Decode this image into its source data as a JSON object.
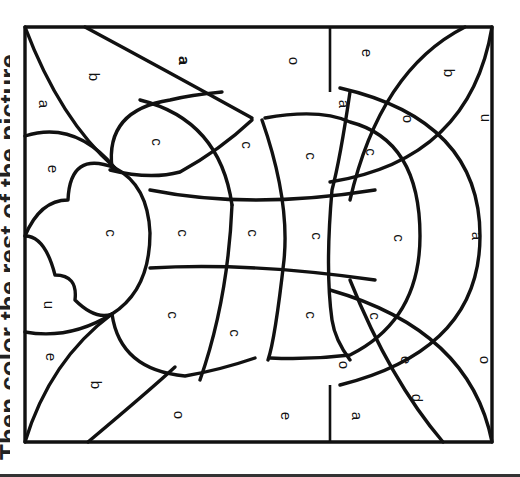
{
  "instructions": {
    "text": "Then color the rest of the picture."
  },
  "colors": {
    "line": "#111111",
    "background": "#ffffff"
  },
  "regions": [
    {
      "letter": "a",
      "x": 43,
      "y": 104
    },
    {
      "letter": "b",
      "x": 93,
      "y": 77
    },
    {
      "letter": "a",
      "x": 183,
      "y": 61
    },
    {
      "letter": "o",
      "x": 293,
      "y": 61
    },
    {
      "letter": "e",
      "x": 366,
      "y": 53
    },
    {
      "letter": "b",
      "x": 448,
      "y": 73
    },
    {
      "letter": "a",
      "x": 343,
      "y": 104
    },
    {
      "letter": "a",
      "x": 183,
      "y": 60
    },
    {
      "letter": "o",
      "x": 407,
      "y": 119
    },
    {
      "letter": "u",
      "x": 485,
      "y": 118
    },
    {
      "letter": "c",
      "x": 156,
      "y": 142
    },
    {
      "letter": "c",
      "x": 246,
      "y": 145
    },
    {
      "letter": "c",
      "x": 310,
      "y": 156
    },
    {
      "letter": "c",
      "x": 370,
      "y": 152
    },
    {
      "letter": "e",
      "x": 52,
      "y": 169
    },
    {
      "letter": "c",
      "x": 110,
      "y": 233
    },
    {
      "letter": "c",
      "x": 182,
      "y": 233
    },
    {
      "letter": "c",
      "x": 252,
      "y": 233
    },
    {
      "letter": "c",
      "x": 316,
      "y": 236
    },
    {
      "letter": "c",
      "x": 398,
      "y": 238
    },
    {
      "letter": "a",
      "x": 476,
      "y": 236
    },
    {
      "letter": "u",
      "x": 48,
      "y": 305
    },
    {
      "letter": "c",
      "x": 172,
      "y": 315
    },
    {
      "letter": "c",
      "x": 310,
      "y": 315
    },
    {
      "letter": "c",
      "x": 374,
      "y": 316
    },
    {
      "letter": "c",
      "x": 234,
      "y": 333
    },
    {
      "letter": "e",
      "x": 50,
      "y": 357
    },
    {
      "letter": "o",
      "x": 343,
      "y": 365
    },
    {
      "letter": "e",
      "x": 405,
      "y": 360
    },
    {
      "letter": "o",
      "x": 484,
      "y": 360
    },
    {
      "letter": "b",
      "x": 95,
      "y": 385
    },
    {
      "letter": "d",
      "x": 416,
      "y": 398
    },
    {
      "letter": "o",
      "x": 178,
      "y": 415
    },
    {
      "letter": "e",
      "x": 285,
      "y": 416
    },
    {
      "letter": "a",
      "x": 356,
      "y": 416
    }
  ]
}
